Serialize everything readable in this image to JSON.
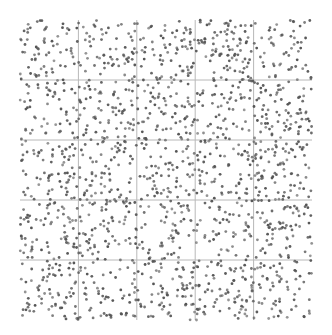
{
  "chart_data": {
    "type": "scatter",
    "title": "",
    "xlabel": "",
    "ylabel": "",
    "grid": true,
    "grid_divisions": 5,
    "legend": null,
    "xlim": [
      0,
      1
    ],
    "ylim": [
      0,
      1
    ],
    "series": [
      {
        "name": "points",
        "distribution": "uniform random over unit square",
        "count": 1700,
        "seed": 12345
      }
    ],
    "plot_area_px": {
      "left": 20,
      "top": 20,
      "right": 312,
      "bottom": 320
    },
    "colors": {
      "point": "#555555",
      "grid": "#b8b8b8",
      "background": "#ffffff"
    },
    "point_radius": 1.4
  }
}
